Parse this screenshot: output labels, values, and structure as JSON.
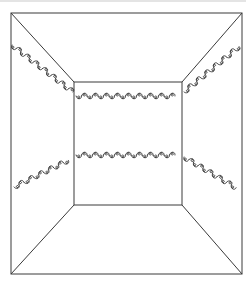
{
  "figure": {
    "kind": "room-perspective-line-drawing",
    "stroke_color": "#3a3a3a",
    "background": "#ffffff",
    "outer_frame": {
      "x1": 11,
      "y1": 13,
      "x2": 242,
      "y2": 274
    },
    "back_wall": {
      "x1": 74,
      "y1": 82,
      "x2": 182,
      "y2": 205
    },
    "garlands": [
      {
        "name": "upper-left",
        "from": [
          12,
          45
        ],
        "to": [
          73,
          92
        ]
      },
      {
        "name": "upper-back",
        "from": [
          76,
          96
        ],
        "to": [
          180,
          96
        ]
      },
      {
        "name": "upper-right",
        "from": [
          184,
          92
        ],
        "to": [
          241,
          45
        ]
      },
      {
        "name": "lower-left",
        "from": [
          14,
          187
        ],
        "to": [
          73,
          158
        ]
      },
      {
        "name": "lower-back",
        "from": [
          76,
          155
        ],
        "to": [
          180,
          155
        ]
      },
      {
        "name": "lower-right",
        "from": [
          184,
          157
        ],
        "to": [
          240,
          190
        ]
      }
    ]
  }
}
